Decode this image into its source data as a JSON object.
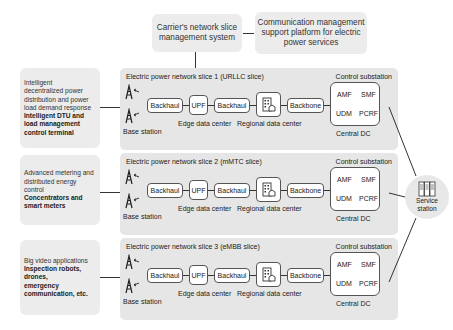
{
  "top": {
    "carrier_system": "Carrier's network slice management system",
    "carrier_lines": [
      "Carrier's network slice",
      "management system"
    ],
    "platform_lines": [
      "Communication management",
      "support platform for electric",
      "power services"
    ]
  },
  "left_boxes": [
    {
      "normal_lines": [
        "Intelligent",
        "decentralized power",
        "distribution and power",
        "load demand response"
      ],
      "bold_lines": [
        "Intelligent DTU and",
        "load management",
        "control terminal"
      ]
    },
    {
      "normal_lines": [
        "Advanced metering and",
        "distributed energy",
        "control"
      ],
      "bold_lines": [
        "Concentrators and",
        "smart meters"
      ]
    },
    {
      "normal_lines": [
        "Big video applications"
      ],
      "bold_lines": [
        "Inspection robots,",
        "drones,",
        "emergency",
        "communication, etc."
      ]
    }
  ],
  "slices": [
    {
      "title": "Electric power network slice 1 (URLLC slice)",
      "control_label": "Control substation",
      "base_station": "Base station",
      "backhaul1": "Backhaul",
      "upf": "UPF",
      "backhaul2": "Backhaul",
      "backbone": "Backbone",
      "edge_dc": "Edge data center",
      "regional_dc": "Regional data center",
      "central_dc": "Central DC",
      "nf": {
        "amf": "AMF",
        "smf": "SMF",
        "udm": "UDM",
        "pcrf": "PCRF"
      }
    },
    {
      "title": "Electric power network slice 2 (mMTC slice)",
      "control_label": "Control substation",
      "base_station": "Base station",
      "backhaul1": "Backhaul",
      "upf": "UPF",
      "backhaul2": "Backhaul",
      "backbone": "Backbone",
      "edge_dc": "Edge data center",
      "regional_dc": "Regional data center",
      "central_dc": "Central DC",
      "nf": {
        "amf": "AMF",
        "smf": "SMF",
        "udm": "UDM",
        "pcrf": "PCRF"
      }
    },
    {
      "title": "Electric power network slice 3 (eMBB slice)",
      "control_label": "Control substation",
      "base_station": "Base station",
      "backhaul1": "Backhaul",
      "upf": "UPF",
      "backhaul2": "Backhaul",
      "backbone": "Backbone",
      "edge_dc": "Edge data center",
      "regional_dc": "Regional data center",
      "central_dc": "Central DC",
      "nf": {
        "amf": "AMF",
        "smf": "SMF",
        "udm": "UDM",
        "pcrf": "PCRF"
      }
    }
  ],
  "service_station": {
    "lines": [
      "Service",
      "station"
    ],
    "icon": "server-rack-icon"
  },
  "icons": {
    "base_station": "radio-tower-icon",
    "regional_dc": "building-icon"
  },
  "colors": {
    "panel": "#e6e6e6",
    "soft_box": "#ececec",
    "line": "#333333",
    "node_border": "#555555"
  }
}
